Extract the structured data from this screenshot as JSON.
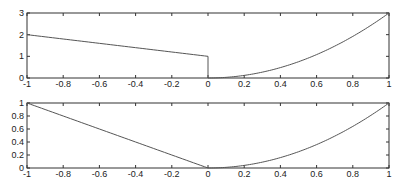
{
  "chart_data": [
    {
      "type": "line",
      "title": "",
      "xlabel": "",
      "ylabel": "",
      "xlim": [
        -1,
        1
      ],
      "ylim": [
        0,
        3
      ],
      "xticks": [
        "-1",
        "-0.8",
        "-0.6",
        "-0.4",
        "-0.2",
        "0",
        "0.2",
        "0.4",
        "0.6",
        "0.8",
        "1"
      ],
      "yticks": [
        "0",
        "1",
        "2",
        "3"
      ],
      "grid": false,
      "series": [
        {
          "name": "piecewise f(x)",
          "description": "1 - x for x < 0 (2 at -1, 1 at 0); vertical drop to 0 at x = 0; 3x^2 for x >= 0 (0 at 0, 3 at 1)",
          "x": [
            -1,
            -0.8,
            -0.6,
            -0.4,
            -0.2,
            0,
            0,
            0.2,
            0.4,
            0.6,
            0.8,
            1
          ],
          "y": [
            2,
            1.8,
            1.6,
            1.4,
            1.2,
            1,
            0,
            0.12,
            0.48,
            1.08,
            1.92,
            3
          ]
        }
      ]
    },
    {
      "type": "line",
      "title": "",
      "xlabel": "",
      "ylabel": "",
      "xlim": [
        -1,
        1
      ],
      "ylim": [
        0,
        1
      ],
      "xticks": [
        "-1",
        "-0.8",
        "-0.6",
        "-0.4",
        "-0.2",
        "0",
        "0.2",
        "0.4",
        "0.6",
        "0.8",
        "1"
      ],
      "yticks": [
        "0",
        "0.2",
        "0.4",
        "0.6",
        "0.8",
        "1"
      ],
      "grid": false,
      "series": [
        {
          "name": "piecewise g(x)",
          "description": "-x for x < 0 (1 at -1, 0 at 0); x^2 for x >= 0 (0 at 0, 1 at 1)",
          "x": [
            -1,
            -0.8,
            -0.6,
            -0.4,
            -0.2,
            0,
            0.2,
            0.4,
            0.6,
            0.8,
            1
          ],
          "y": [
            1,
            0.8,
            0.6,
            0.4,
            0.2,
            0,
            0.04,
            0.16,
            0.36,
            0.64,
            1
          ]
        }
      ]
    }
  ]
}
